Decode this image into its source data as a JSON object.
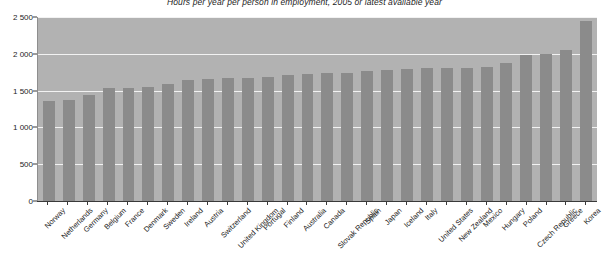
{
  "chart_data": {
    "type": "bar",
    "title": "Hours per year per person in employment, 2005 or latest available year",
    "xlabel": "",
    "ylabel": "",
    "ylim": [
      0,
      2500
    ],
    "ytick_labels": [
      "0",
      "500",
      "1 000",
      "1 500",
      "2 000",
      "2 500"
    ],
    "yticks": [
      0,
      500,
      1000,
      1500,
      2000,
      2500
    ],
    "grid": true,
    "legend": "none",
    "bar_color": "#8b8b8b",
    "plot_background": "#b2b2b2",
    "categories": [
      "Norway",
      "Netherlands",
      "Germany",
      "Belgium",
      "France",
      "Denmark",
      "Sweden",
      "Ireland",
      "Austria",
      "Switzerland",
      "United Kingdom",
      "Portugal",
      "Finland",
      "Australia",
      "Canada",
      "Slovak Republic",
      "Spain",
      "Japan",
      "Iceland",
      "Italy",
      "United States",
      "New Zealand",
      "Mexico",
      "Hungary",
      "Poland",
      "Czech Republic",
      "Greece",
      "Korea"
    ],
    "values": [
      1360,
      1367,
      1437,
      1534,
      1535,
      1551,
      1587,
      1638,
      1655,
      1673,
      1672,
      1686,
      1714,
      1727,
      1738,
      1745,
      1772,
      1775,
      1794,
      1813,
      1804,
      1808,
      1826,
      1880,
      1984,
      1997,
      2053,
      2440
    ]
  }
}
